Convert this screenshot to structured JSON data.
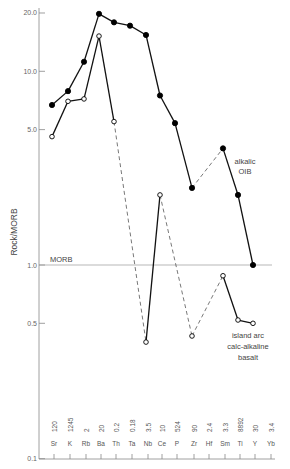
{
  "chart_data": {
    "type": "line",
    "title": "",
    "xlabel": "",
    "ylabel": "Rock/MORB",
    "yscale": "log",
    "ylim": [
      0.1,
      20.0
    ],
    "yticks": [
      {
        "value": 20.0,
        "label": "20.0"
      },
      {
        "value": 10.0,
        "label": "10.0"
      },
      {
        "value": 5.0,
        "label": "5.0"
      },
      {
        "value": 1.0,
        "label": "1.0"
      },
      {
        "value": 0.5,
        "label": "0.5"
      },
      {
        "value": 0.1,
        "label": "0.1"
      }
    ],
    "grid": false,
    "categories": [
      "Sr",
      "K",
      "Rb",
      "Ba",
      "Th",
      "Ta",
      "Nb",
      "Ce",
      "P",
      "Zr",
      "Hf",
      "Sm",
      "Ti",
      "Y",
      "Yb"
    ],
    "morb_normalizing_values": [
      "120",
      "1245",
      "2",
      "20",
      "0.2",
      "0.18",
      "3.5",
      "10",
      "524",
      "90",
      "2.4",
      "3.3",
      "8892",
      "30",
      "3.4"
    ],
    "reference_line": {
      "value": 1.0,
      "label": "MORB"
    },
    "series": [
      {
        "name": "alkalic OIB",
        "label_lines": [
          "alkalic",
          "OIB"
        ],
        "marker": "filled-circle",
        "values": [
          6.7,
          7.9,
          11.2,
          19.8,
          17.9,
          17.2,
          15.4,
          7.5,
          5.4,
          2.5,
          null,
          4.0,
          2.3,
          1.0,
          null
        ],
        "dashed_segments": [
          [
            "Zr",
            "Sm"
          ]
        ]
      },
      {
        "name": "island arc calc-alkaline basalt",
        "label_lines": [
          "island arc",
          "calc-alkaline",
          "basalt"
        ],
        "marker": "open-circle",
        "values": [
          4.6,
          7.0,
          7.2,
          15.2,
          5.5,
          null,
          0.4,
          2.3,
          null,
          0.43,
          null,
          0.88,
          0.52,
          0.5,
          null
        ],
        "dashed_segments": [
          [
            "Th",
            "Nb"
          ],
          [
            "Ce",
            "Zr"
          ],
          [
            "Zr",
            "Sm"
          ]
        ]
      }
    ]
  }
}
